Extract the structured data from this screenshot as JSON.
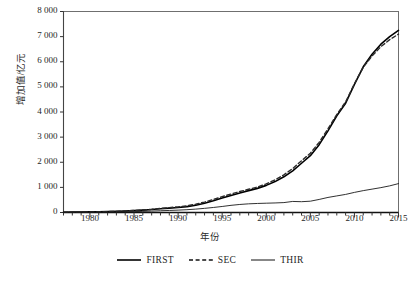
{
  "chart_data": {
    "type": "line",
    "title": "",
    "xlabel": "年份",
    "ylabel": "增加值/亿元",
    "xlim": [
      1977,
      2015
    ],
    "ylim": [
      0,
      8000
    ],
    "grid": false,
    "legend_position": "bottom-center",
    "x_ticks": [
      "1980",
      "1985",
      "1990",
      "1995",
      "2000",
      "2005",
      "2010",
      "2015"
    ],
    "x_tick_values": [
      1980,
      1985,
      1990,
      1995,
      2000,
      2005,
      2010,
      2015
    ],
    "y_ticks": [
      "0",
      "1 000",
      "2 000",
      "3 000",
      "4 000",
      "5 000",
      "6 000",
      "7 000",
      "8 000"
    ],
    "y_tick_values": [
      0,
      1000,
      2000,
      3000,
      4000,
      5000,
      6000,
      7000,
      8000
    ],
    "x": [
      1977,
      1978,
      1979,
      1980,
      1981,
      1982,
      1983,
      1984,
      1985,
      1986,
      1987,
      1988,
      1989,
      1990,
      1991,
      1992,
      1993,
      1994,
      1995,
      1996,
      1997,
      1998,
      1999,
      2000,
      2001,
      2002,
      2003,
      2004,
      2005,
      2006,
      2007,
      2008,
      2009,
      2010,
      2011,
      2012,
      2013,
      2014,
      2015
    ],
    "series": [
      {
        "name": "FIRST",
        "style": "solid",
        "color": "#000000",
        "width": 1.6,
        "values": [
          12,
          15,
          19,
          24,
          30,
          38,
          47,
          60,
          78,
          95,
          118,
          150,
          175,
          200,
          235,
          290,
          370,
          470,
          580,
          680,
          780,
          870,
          960,
          1080,
          1230,
          1420,
          1660,
          1960,
          2260,
          2700,
          3250,
          3850,
          4350,
          5100,
          5800,
          6300,
          6700,
          7000,
          7250
        ]
      },
      {
        "name": "SEC",
        "style": "dashed",
        "color": "#2b2b2b",
        "width": 1.4,
        "values": [
          10,
          13,
          17,
          22,
          28,
          36,
          46,
          60,
          80,
          100,
          128,
          165,
          195,
          225,
          265,
          330,
          415,
          520,
          630,
          735,
          835,
          925,
          1015,
          1140,
          1300,
          1500,
          1750,
          2060,
          2360,
          2790,
          3330,
          3900,
          4400,
          5120,
          5780,
          6230,
          6600,
          6880,
          7100
        ]
      },
      {
        "name": "THIR",
        "style": "solid",
        "color": "#1a1a1a",
        "width": 0.9,
        "values": [
          5,
          6,
          8,
          10,
          13,
          17,
          22,
          28,
          36,
          45,
          56,
          70,
          82,
          95,
          112,
          135,
          165,
          200,
          240,
          285,
          320,
          345,
          360,
          370,
          380,
          395,
          440,
          430,
          450,
          520,
          600,
          660,
          720,
          800,
          870,
          930,
          990,
          1060,
          1150
        ]
      }
    ]
  },
  "legend": {
    "items": [
      {
        "label": "FIRST",
        "style": "solid"
      },
      {
        "label": "SEC",
        "style": "dashed"
      },
      {
        "label": "THIR",
        "style": "solid-thin"
      }
    ]
  }
}
